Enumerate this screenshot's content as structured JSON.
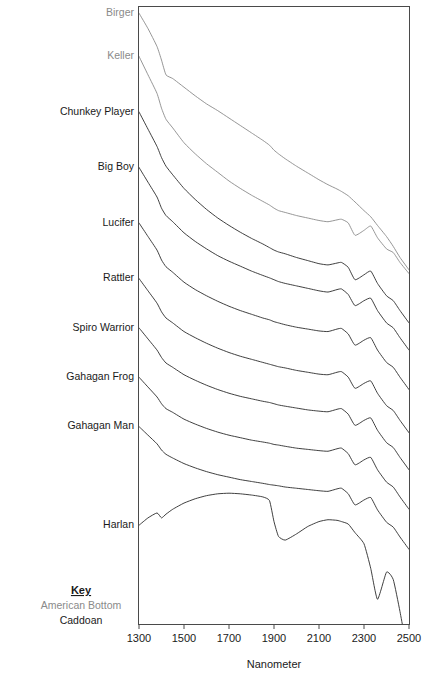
{
  "chart_data": {
    "type": "line",
    "title": "",
    "xlabel": "Nanometer",
    "ylabel": "",
    "xlim": [
      1300,
      2500
    ],
    "ylim": [
      0,
      100
    ],
    "xticks": [
      1300,
      1500,
      1700,
      1900,
      2100,
      2300,
      2500
    ],
    "xtick_labels": [
      "1300",
      "1500",
      "1700",
      "1900",
      "2100",
      "2300",
      "2500"
    ],
    "grid": false,
    "legend_position": "bottom-left",
    "note": "Stacked (vertically offset) near-infrared reflectance spectra; each series is labeled at its left-hand origin on the y-axis.",
    "x": [
      1300,
      1340,
      1380,
      1400,
      1420,
      1450,
      1500,
      1550,
      1600,
      1650,
      1700,
      1750,
      1800,
      1850,
      1880,
      1900,
      1920,
      1950,
      2000,
      2050,
      2100,
      2140,
      2180,
      2200,
      2230,
      2260,
      2300,
      2330,
      2360,
      2400,
      2430,
      2460,
      2500
    ],
    "series": [
      {
        "name": "Birger",
        "group": "American Bottom",
        "color": "#8a8a8a",
        "values": [
          99.0,
          96.5,
          93.6,
          91.4,
          89.0,
          88.4,
          87.0,
          85.6,
          84.3,
          83.2,
          82.0,
          80.8,
          79.6,
          78.4,
          77.6,
          76.8,
          76.2,
          75.4,
          74.2,
          73.1,
          72.0,
          71.2,
          70.5,
          70.1,
          69.4,
          68.4,
          67.0,
          66.0,
          64.6,
          62.8,
          61.2,
          59.4,
          57.4
        ]
      },
      {
        "name": "Keller",
        "group": "American Bottom",
        "color": "#8a8a8a",
        "values": [
          92.0,
          89.0,
          86.0,
          83.6,
          81.8,
          80.4,
          78.0,
          76.2,
          74.6,
          73.2,
          71.8,
          70.6,
          69.5,
          68.5,
          67.9,
          67.4,
          67.0,
          66.7,
          66.2,
          65.8,
          65.4,
          65.2,
          65.5,
          65.6,
          65.0,
          63.0,
          63.8,
          64.5,
          62.6,
          60.8,
          60.2,
          58.6,
          56.8
        ]
      },
      {
        "name": "Chunkey Player",
        "group": "Caddoan",
        "color": "#2a2a2a",
        "values": [
          83.0,
          80.2,
          77.4,
          75.6,
          74.2,
          72.8,
          70.6,
          68.8,
          67.2,
          65.8,
          64.6,
          63.5,
          62.5,
          61.6,
          61.0,
          60.6,
          60.3,
          60.0,
          59.4,
          58.9,
          58.4,
          58.2,
          58.5,
          58.6,
          57.8,
          55.8,
          56.6,
          57.2,
          55.2,
          53.2,
          52.4,
          50.8,
          48.8
        ]
      },
      {
        "name": "Big Boy",
        "group": "Caddoan",
        "color": "#2a2a2a",
        "values": [
          74.0,
          71.6,
          69.2,
          67.4,
          66.2,
          65.2,
          63.4,
          62.0,
          60.8,
          59.7,
          58.8,
          58.0,
          57.2,
          56.5,
          56.1,
          55.8,
          55.5,
          55.2,
          54.8,
          54.4,
          54.0,
          53.8,
          54.2,
          54.3,
          53.4,
          51.6,
          52.4,
          52.8,
          50.8,
          48.8,
          48.0,
          46.4,
          44.4
        ]
      },
      {
        "name": "Lucifer",
        "group": "Caddoan",
        "color": "#2a2a2a",
        "values": [
          65.0,
          62.8,
          60.6,
          59.0,
          57.9,
          57.0,
          55.4,
          54.2,
          53.2,
          52.3,
          51.5,
          50.8,
          50.2,
          49.6,
          49.3,
          49.0,
          48.8,
          48.5,
          48.1,
          47.8,
          47.5,
          47.4,
          47.8,
          47.9,
          47.0,
          45.2,
          46.0,
          46.4,
          44.4,
          42.4,
          41.6,
          40.0,
          38.0
        ]
      },
      {
        "name": "Rattler",
        "group": "Caddoan",
        "color": "#2a2a2a",
        "values": [
          56.0,
          54.0,
          52.0,
          50.6,
          49.6,
          48.8,
          47.4,
          46.4,
          45.5,
          44.7,
          44.0,
          43.4,
          42.9,
          42.4,
          42.1,
          41.9,
          41.7,
          41.5,
          41.1,
          40.8,
          40.5,
          40.4,
          40.8,
          40.9,
          40.0,
          38.2,
          39.0,
          39.4,
          37.4,
          35.4,
          34.6,
          33.0,
          31.0
        ]
      },
      {
        "name": "Spiro Warrior",
        "group": "Caddoan",
        "color": "#2a2a2a",
        "values": [
          48.0,
          46.2,
          44.4,
          43.2,
          42.3,
          41.6,
          40.4,
          39.5,
          38.7,
          38.0,
          37.4,
          36.9,
          36.5,
          36.1,
          35.9,
          35.7,
          35.5,
          35.3,
          35.0,
          34.7,
          34.5,
          34.4,
          34.8,
          34.9,
          34.0,
          32.2,
          33.0,
          33.4,
          31.4,
          29.4,
          28.6,
          27.0,
          25.0
        ]
      },
      {
        "name": "Gahagan Frog",
        "group": "Caddoan",
        "color": "#2a2a2a",
        "values": [
          40.0,
          38.4,
          36.8,
          35.7,
          34.9,
          34.3,
          33.2,
          32.4,
          31.7,
          31.1,
          30.6,
          30.2,
          29.8,
          29.5,
          29.3,
          29.1,
          29.0,
          28.8,
          28.5,
          28.3,
          28.1,
          28.0,
          28.4,
          28.5,
          27.6,
          25.8,
          26.6,
          27.0,
          25.0,
          23.0,
          22.2,
          20.6,
          18.6
        ]
      },
      {
        "name": "Gahagan Man",
        "group": "Caddoan",
        "color": "#2a2a2a",
        "values": [
          32.0,
          30.6,
          29.2,
          28.2,
          27.5,
          26.9,
          26.0,
          25.3,
          24.7,
          24.2,
          23.8,
          23.4,
          23.1,
          22.8,
          22.6,
          22.5,
          22.4,
          22.2,
          22.0,
          21.8,
          21.6,
          21.5,
          21.9,
          22.0,
          21.1,
          19.3,
          20.1,
          20.5,
          18.5,
          16.5,
          15.7,
          14.1,
          12.1
        ]
      },
      {
        "name": "Harlan",
        "group": "Caddoan",
        "color": "#2a2a2a",
        "values": [
          16.0,
          17.2,
          18.0,
          17.2,
          17.8,
          18.6,
          19.6,
          20.3,
          20.8,
          21.1,
          21.2,
          21.1,
          20.9,
          20.6,
          20.0,
          16.6,
          14.2,
          13.6,
          14.6,
          15.8,
          16.6,
          16.9,
          16.8,
          16.6,
          16.2,
          14.8,
          13.0,
          9.0,
          4.0,
          8.4,
          7.2,
          2.0,
          -6.0
        ]
      }
    ]
  },
  "series_labels": [
    {
      "text": "Birger",
      "color": "#8a8a8a"
    },
    {
      "text": "Keller",
      "color": "#8a8a8a"
    },
    {
      "text": "Chunkey Player",
      "color": "#1a1a1a"
    },
    {
      "text": "Big Boy",
      "color": "#1a1a1a"
    },
    {
      "text": "Lucifer",
      "color": "#1a1a1a"
    },
    {
      "text": "Rattler",
      "color": "#1a1a1a"
    },
    {
      "text": "Spiro Warrior",
      "color": "#1a1a1a"
    },
    {
      "text": "Gahagan Frog",
      "color": "#1a1a1a"
    },
    {
      "text": "Gahagan Man",
      "color": "#1a1a1a"
    },
    {
      "text": "Harlan",
      "color": "#1a1a1a"
    }
  ],
  "key": {
    "title": "Key",
    "entries": [
      {
        "label": "American Bottom",
        "color": "#8a8a8a"
      },
      {
        "label": "Caddoan",
        "color": "#1a1a1a"
      }
    ]
  },
  "axis": {
    "x_title": "Nanometer",
    "tick_labels": [
      "1300",
      "1500",
      "1700",
      "1900",
      "2100",
      "2300",
      "2500"
    ]
  }
}
